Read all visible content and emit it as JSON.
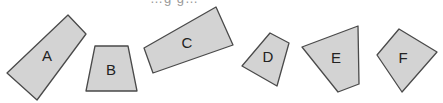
{
  "header": {
    "cut_off_text": "…g g…"
  },
  "shapes": [
    {
      "id": "A",
      "label": "A",
      "points": "68,15 86,34 37,100 7,73",
      "label_pos": [
        47,
        56
      ]
    },
    {
      "id": "B",
      "label": "B",
      "points": "95,46 128,46 137,91 86,91",
      "label_pos": [
        111,
        70
      ]
    },
    {
      "id": "C",
      "label": "C",
      "points": "216,7 233,45 153,73 144,48",
      "label_pos": [
        187,
        43
      ]
    },
    {
      "id": "D",
      "label": "D",
      "points": "270,33 289,43 277,86 242,66",
      "label_pos": [
        268,
        57
      ]
    },
    {
      "id": "E",
      "label": "E",
      "points": "302,47 358,26 359,84 338,92",
      "label_pos": [
        336,
        58
      ]
    },
    {
      "id": "F",
      "label": "F",
      "points": "399,29 437,52 402,92 377,55",
      "label_pos": [
        403,
        58
      ]
    }
  ],
  "colors": {
    "fill": "#d3d3d3",
    "stroke": "#4a4a4a",
    "text": "#222222"
  }
}
